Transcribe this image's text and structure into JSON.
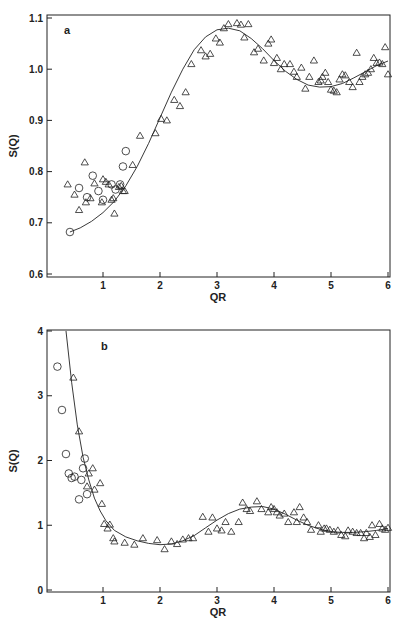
{
  "chart_data": [
    {
      "type": "scatter",
      "panel_label": "a",
      "xlabel": "QR",
      "ylabel": "S(Q)",
      "xlim": [
        0,
        6
      ],
      "ylim": [
        0.6,
        1.1
      ],
      "xticks": [
        "1",
        "2",
        "3",
        "4",
        "5",
        "6"
      ],
      "xtick_values": [
        1,
        2,
        3,
        4,
        5,
        6
      ],
      "yticks": [
        "0.6",
        "0.7",
        "0.8",
        "0.9",
        "1.0",
        "1.1"
      ],
      "ytick_values": [
        0.6,
        0.7,
        0.8,
        0.9,
        1.0,
        1.1
      ],
      "grid": false,
      "series": [
        {
          "name": "triangles",
          "marker": "triangle",
          "x": [
            0.38,
            0.5,
            0.58,
            0.68,
            0.7,
            0.78,
            0.85,
            0.98,
            1.0,
            1.05,
            1.1,
            1.15,
            1.18,
            1.2,
            1.28,
            1.32,
            1.35,
            1.38,
            1.52,
            1.65,
            1.92,
            2.02,
            2.12,
            2.25,
            2.35,
            2.45,
            2.55,
            2.72,
            2.8,
            2.88,
            2.98,
            3.05,
            3.12,
            3.2,
            3.35,
            3.42,
            3.48,
            3.55,
            3.65,
            3.72,
            3.82,
            3.9,
            3.95,
            4.0,
            4.05,
            4.12,
            4.18,
            4.28,
            4.35,
            4.4,
            4.48,
            4.55,
            4.62,
            4.7,
            4.78,
            4.82,
            4.85,
            4.9,
            4.95,
            5.0,
            5.05,
            5.1,
            5.15,
            5.2,
            5.25,
            5.32,
            5.38,
            5.45,
            5.5,
            5.55,
            5.6,
            5.65,
            5.7,
            5.75,
            5.8,
            5.85,
            5.9,
            5.95,
            6.0
          ],
          "y": [
            0.775,
            0.755,
            0.725,
            0.818,
            0.74,
            0.748,
            0.777,
            0.74,
            0.785,
            0.78,
            0.775,
            0.745,
            0.748,
            0.718,
            0.77,
            0.772,
            0.762,
            0.762,
            0.813,
            0.87,
            0.875,
            0.903,
            0.9,
            0.94,
            0.928,
            0.955,
            1.01,
            1.037,
            1.025,
            1.03,
            1.06,
            1.052,
            1.08,
            1.088,
            1.09,
            1.087,
            1.062,
            1.088,
            1.033,
            1.04,
            1.017,
            1.05,
            1.058,
            1.012,
            1.022,
            1.0,
            1.01,
            1.01,
            0.995,
            0.985,
            1.003,
            0.962,
            0.985,
            1.017,
            0.975,
            0.978,
            0.985,
            0.993,
            0.975,
            0.96,
            0.958,
            0.955,
            0.98,
            0.99,
            0.988,
            0.975,
            0.965,
            1.032,
            0.975,
            0.985,
            0.99,
            0.993,
            1.0,
            1.022,
            1.012,
            1.013,
            1.01,
            1.043,
            0.99
          ]
        },
        {
          "name": "circles",
          "marker": "circle",
          "x": [
            0.42,
            0.58,
            0.72,
            0.82,
            0.92,
            1.0,
            1.15,
            1.22,
            1.3,
            1.35,
            1.4
          ],
          "y": [
            0.682,
            0.768,
            0.75,
            0.792,
            0.762,
            0.745,
            0.775,
            0.765,
            0.775,
            0.81,
            0.84
          ]
        },
        {
          "name": "fit",
          "marker": "line",
          "x": [
            0.42,
            0.6,
            0.8,
            1.0,
            1.2,
            1.4,
            1.6,
            1.8,
            2.0,
            2.2,
            2.4,
            2.6,
            2.8,
            3.0,
            3.2,
            3.4,
            3.6,
            3.8,
            4.0,
            4.2,
            4.4,
            4.6,
            4.8,
            5.0,
            5.2,
            5.4,
            5.6,
            5.8,
            6.0
          ],
          "y": [
            0.682,
            0.69,
            0.703,
            0.72,
            0.742,
            0.772,
            0.81,
            0.855,
            0.905,
            0.955,
            1.0,
            1.038,
            1.063,
            1.077,
            1.08,
            1.075,
            1.06,
            1.04,
            1.017,
            0.996,
            0.98,
            0.969,
            0.965,
            0.966,
            0.972,
            0.983,
            0.995,
            1.007,
            1.016
          ]
        }
      ]
    },
    {
      "type": "scatter",
      "panel_label": "b",
      "xlabel": "QR",
      "ylabel": "S(Q)",
      "xlim": [
        0,
        6
      ],
      "ylim": [
        0,
        4
      ],
      "xticks": [
        "1",
        "2",
        "3",
        "4",
        "5",
        "6"
      ],
      "xtick_values": [
        1,
        2,
        3,
        4,
        5,
        6
      ],
      "yticks": [
        "0",
        "1",
        "2",
        "3",
        "4"
      ],
      "ytick_values": [
        0,
        1,
        2,
        3,
        4
      ],
      "grid": false,
      "series": [
        {
          "name": "triangles",
          "marker": "triangle",
          "x": [
            0.48,
            0.58,
            0.72,
            0.75,
            0.82,
            0.85,
            0.95,
            0.98,
            1.02,
            1.08,
            1.12,
            1.18,
            1.2,
            1.38,
            1.55,
            1.7,
            1.95,
            2.08,
            2.2,
            2.3,
            2.4,
            2.5,
            2.58,
            2.75,
            2.85,
            2.92,
            3.0,
            3.08,
            3.15,
            3.25,
            3.38,
            3.45,
            3.52,
            3.58,
            3.7,
            3.78,
            3.9,
            3.95,
            4.0,
            4.05,
            4.1,
            4.18,
            4.25,
            4.35,
            4.4,
            4.45,
            4.52,
            4.58,
            4.65,
            4.78,
            4.82,
            4.88,
            4.92,
            4.98,
            5.05,
            5.12,
            5.18,
            5.25,
            5.3,
            5.38,
            5.45,
            5.52,
            5.58,
            5.62,
            5.68,
            5.72,
            5.78,
            5.85,
            5.9,
            5.95,
            6.0
          ],
          "y": [
            3.28,
            2.45,
            1.6,
            1.8,
            1.88,
            1.55,
            1.65,
            1.33,
            1.02,
            0.95,
            1.01,
            0.8,
            0.75,
            0.73,
            0.7,
            0.8,
            0.77,
            0.63,
            0.75,
            0.71,
            0.78,
            0.8,
            0.8,
            1.13,
            0.9,
            1.12,
            0.95,
            0.92,
            1.05,
            0.9,
            1.05,
            1.35,
            1.25,
            1.22,
            1.37,
            1.25,
            1.2,
            1.28,
            1.25,
            1.2,
            1.15,
            1.18,
            1.05,
            1.2,
            1.05,
            1.28,
            1.12,
            1.05,
            0.93,
            1.0,
            0.9,
            0.95,
            0.95,
            0.93,
            0.9,
            0.92,
            0.85,
            0.83,
            0.92,
            0.9,
            0.88,
            0.88,
            0.8,
            0.88,
            0.82,
            1.0,
            0.85,
            1.02,
            0.95,
            0.93,
            0.96
          ]
        },
        {
          "name": "circles",
          "marker": "circle",
          "x": [
            0.2,
            0.28,
            0.35,
            0.4,
            0.45,
            0.5,
            0.58,
            0.62,
            0.65,
            0.68,
            0.72
          ],
          "y": [
            3.45,
            2.78,
            2.1,
            1.8,
            1.73,
            1.75,
            1.4,
            1.7,
            1.88,
            2.03,
            1.48
          ]
        },
        {
          "name": "fit",
          "marker": "line",
          "x": [
            0.35,
            0.45,
            0.55,
            0.65,
            0.75,
            0.85,
            0.95,
            1.05,
            1.2,
            1.4,
            1.6,
            1.8,
            2.0,
            2.2,
            2.4,
            2.6,
            2.8,
            3.0,
            3.2,
            3.4,
            3.6,
            3.8,
            4.0,
            4.2,
            4.4,
            4.6,
            4.8,
            5.0,
            5.2,
            5.4,
            5.6,
            5.8,
            6.0
          ],
          "y": [
            4.0,
            3.2,
            2.55,
            2.05,
            1.7,
            1.42,
            1.22,
            1.07,
            0.92,
            0.82,
            0.76,
            0.72,
            0.7,
            0.71,
            0.76,
            0.84,
            0.96,
            1.08,
            1.18,
            1.25,
            1.28,
            1.29,
            1.25,
            1.17,
            1.08,
            1.0,
            0.94,
            0.9,
            0.89,
            0.89,
            0.9,
            0.92,
            0.95
          ]
        }
      ]
    }
  ]
}
